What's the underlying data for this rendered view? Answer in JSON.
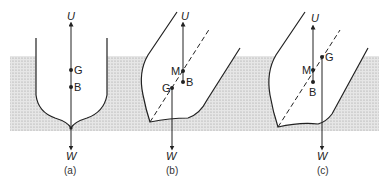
{
  "figure": {
    "water_color": "#d9d9d9",
    "line_color": "#222222",
    "panels": [
      {
        "id": "a",
        "caption": "(a)",
        "labels": {
          "U": "U",
          "W": "W",
          "G": "G",
          "B": "B"
        }
      },
      {
        "id": "b",
        "caption": "(b)",
        "labels": {
          "U": "U",
          "W": "W",
          "G": "G",
          "B": "B",
          "M": "M"
        }
      },
      {
        "id": "c",
        "caption": "(c)",
        "labels": {
          "U": "U",
          "W": "W",
          "G": "G",
          "B": "B",
          "M": "M"
        }
      }
    ]
  }
}
